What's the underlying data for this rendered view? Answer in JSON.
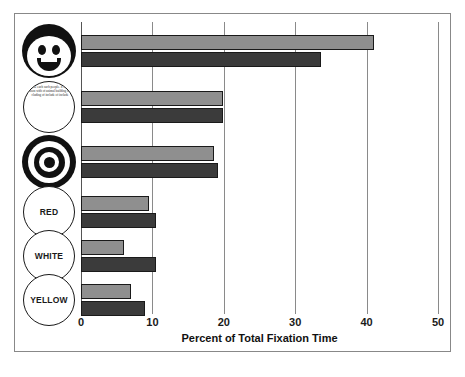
{
  "chart_data": {
    "type": "bar",
    "orientation": "horizontal",
    "title": "",
    "xlabel": "Percent of Total Fixation Time",
    "ylabel": "",
    "xlim": [
      0,
      50
    ],
    "xticks": [
      0,
      10,
      20,
      30,
      40,
      50
    ],
    "grid": true,
    "grid_axis": "x",
    "legend": "none",
    "categories": [
      "face-drawing",
      "text-paragraph",
      "bullseye-target",
      "RED",
      "WHITE",
      "YELLOW"
    ],
    "series": [
      {
        "name": "light-bar",
        "color": "#8f8f8f",
        "values": [
          41.0,
          19.9,
          18.6,
          9.5,
          6.0,
          7.0
        ]
      },
      {
        "name": "dark-bar",
        "color": "#3b3b3b",
        "values": [
          33.6,
          19.9,
          19.2,
          10.5,
          10.5,
          9.0
        ]
      }
    ]
  },
  "axis": {
    "tick_labels": [
      "0",
      "10",
      "20",
      "30",
      "40",
      "50"
    ],
    "title": "Percent of Total Fixation Time"
  },
  "icons": [
    {
      "name": "face-icon",
      "label": ""
    },
    {
      "name": "text-paragraph-icon",
      "label": "and the each such people. if that, he reason with of animal building of including of include of include"
    },
    {
      "name": "bullseye-icon",
      "label": ""
    },
    {
      "name": "red-circle-label",
      "label": "RED"
    },
    {
      "name": "white-circle-label",
      "label": "WHITE"
    },
    {
      "name": "yellow-circle-label",
      "label": "YELLOW"
    }
  ]
}
